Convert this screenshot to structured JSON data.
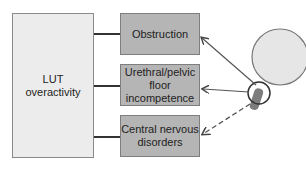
{
  "diagram": {
    "main_box": {
      "label": "LUT overactivity"
    },
    "causes": [
      {
        "label": "Obstruction",
        "arrow": "solid"
      },
      {
        "label": "Urethral/pelvic floor incompetence",
        "arrow": "solid"
      },
      {
        "label": "Central nervous disorders",
        "arrow": "dashed"
      }
    ],
    "illustration": {
      "name": "bladder-and-urethra"
    },
    "colors": {
      "main_box_fill": "#ececec",
      "cause_box_fill": "#b5b5b5",
      "bladder_fill": "#e6e6e6",
      "urethra_fill": "#7d7d7d",
      "line": "#333333"
    }
  }
}
